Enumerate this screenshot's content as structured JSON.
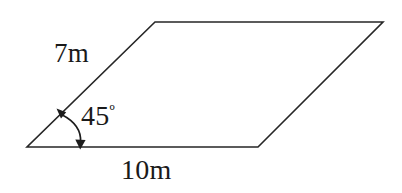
{
  "figure": {
    "type": "parallelogram-geometry-diagram",
    "background_color": "#ffffff",
    "stroke_color": "#262626",
    "text_color": "#1a1a1a",
    "labels": {
      "left_side": "7m",
      "bottom_side": "10m",
      "angle_value": "45",
      "angle_degree_symbol": "º",
      "angle_full": "45º"
    },
    "measurements": {
      "left_side_length": "7m",
      "bottom_side_length": "10m",
      "interior_angle": "45º"
    },
    "vertices": {
      "bottom_left": [
        27,
        147
      ],
      "bottom_right": [
        258,
        147
      ],
      "top_right": [
        383,
        22
      ],
      "top_left": [
        155,
        22
      ]
    },
    "angle_marker": {
      "at_vertex": "bottom_left",
      "arrow_style": "double-headed-curved-arc",
      "arc_start": [
        60,
        112
      ],
      "arc_end": [
        78,
        146
      ]
    }
  }
}
